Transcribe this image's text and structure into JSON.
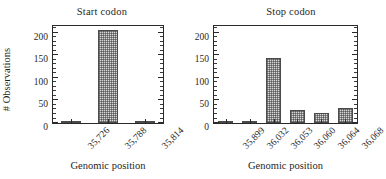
{
  "figure": {
    "axis_title_y": "# Observations",
    "axis_title_x": "Genomic position"
  },
  "panels": [
    {
      "id": "start",
      "title": "Start codon"
    },
    {
      "id": "stop",
      "title": "Stop codon"
    }
  ],
  "yticks": [
    "0",
    "50",
    "100",
    "150",
    "200"
  ],
  "chart_data": [
    {
      "type": "bar",
      "title": "Start codon",
      "xlabel": "Genomic position",
      "ylabel": "# Observations",
      "categories": [
        "35,726",
        "35,788",
        "35,814"
      ],
      "values": [
        2,
        207,
        2
      ],
      "ylim": [
        0,
        215
      ],
      "yticks": [
        0,
        50,
        100,
        150,
        200
      ],
      "yminor_step": 10,
      "grid": false,
      "legend": "none",
      "bar_fill": "#d9d9d9",
      "bar_edge": "#4a4a4a",
      "bar_hatch": "cross-hatch-dots"
    },
    {
      "type": "bar",
      "title": "Stop codon",
      "xlabel": "Genomic position",
      "ylabel": "# Observations",
      "categories": [
        "35,899",
        "36,032",
        "36,053",
        "36,060",
        "36,064",
        "36,068"
      ],
      "values": [
        2,
        2,
        145,
        28,
        23,
        33
      ],
      "ylim": [
        0,
        215
      ],
      "yticks": [
        0,
        50,
        100,
        150,
        200
      ],
      "yminor_step": 10,
      "grid": false,
      "legend": "none",
      "bar_fill": "#d9d9d9",
      "bar_edge": "#4a4a4a",
      "bar_hatch": "cross-hatch-dots"
    }
  ]
}
